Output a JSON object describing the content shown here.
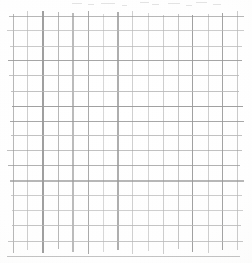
{
  "page": {
    "kind": "graph-paper-scan",
    "width": 252,
    "height": 263,
    "background_color": "#fdfdfc",
    "has_text": false,
    "has_handwriting": false,
    "caption": ""
  },
  "grid": {
    "cell_size_px": 15,
    "origin_x": 13,
    "origin_y": 16,
    "vertical_line_count": 16,
    "horizontal_line_count": 17,
    "line_color": "#9a9a9a",
    "line_color_light": "#b8b8b8",
    "line_width_px": 1,
    "x_start": 13,
    "x_end": 238,
    "y_start": 16,
    "y_end": 247,
    "overshoot_px": 5
  },
  "artifacts": {
    "top_edge_speckle": true,
    "speckle_color": "#e3e3e3"
  }
}
